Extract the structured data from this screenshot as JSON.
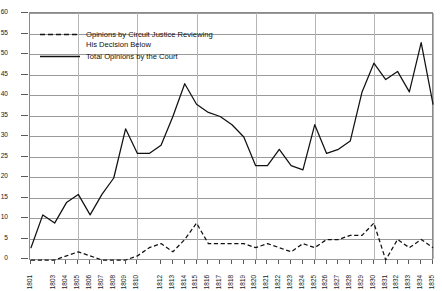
{
  "chart_data": {
    "type": "line",
    "title": "",
    "xlabel": "",
    "ylabel": "",
    "xlim": [
      1801,
      1835
    ],
    "ylim": [
      0,
      60
    ],
    "ytick_step": 5,
    "grid": true,
    "legend_position": "upper-left",
    "yticks": [
      0,
      5,
      10,
      15,
      20,
      25,
      30,
      35,
      40,
      45,
      50,
      55,
      60
    ],
    "categories": [
      "1801",
      "1802",
      "1803",
      "1804",
      "1805",
      "1806",
      "1807",
      "1808",
      "1809",
      "1810",
      "1811",
      "1812",
      "1813",
      "1814",
      "1815",
      "1816",
      "1817",
      "1818",
      "1819",
      "1820",
      "1821",
      "1822",
      "1823",
      "1824",
      "1825",
      "1826",
      "1827",
      "1828",
      "1829",
      "1830",
      "1831",
      "1832",
      "1833",
      "1834",
      "1835"
    ],
    "xtick_labels": [
      "1801",
      "1803",
      "1804",
      "1805",
      "1806",
      "1807",
      "1808",
      "1809",
      "1810",
      "1812",
      "1813",
      "1814",
      "1815",
      "1816",
      "1817",
      "1818",
      "1819",
      "1820",
      "1821",
      "1822",
      "1823",
      "1824",
      "1825",
      "1826",
      "1827",
      "1828",
      "1829",
      "1830",
      "1831",
      "1832",
      "1833",
      "1834",
      "1835"
    ],
    "series": [
      {
        "name": "Total Opinions by the Court",
        "style": "solid",
        "values": [
          3,
          11,
          9,
          14,
          16,
          11,
          16,
          20,
          32,
          26,
          26,
          28,
          35,
          43,
          38,
          36,
          35,
          33,
          30,
          23,
          23,
          27,
          23,
          22,
          33,
          26,
          27,
          29,
          41,
          48,
          44,
          46,
          41,
          53,
          38
        ]
      },
      {
        "name": "Opinions by Circuit Justice Reviewing His Decision Below",
        "style": "dashed",
        "values": [
          0,
          0,
          0,
          1,
          2,
          1,
          0,
          0,
          0,
          1,
          3,
          4,
          2,
          5,
          9,
          4,
          4,
          4,
          4,
          3,
          4,
          3,
          2,
          4,
          3,
          5,
          5,
          6,
          6,
          9,
          0,
          5,
          3,
          5,
          3
        ]
      }
    ]
  },
  "legend": {
    "entries": [
      {
        "swatch": "dashed-line-swatch",
        "label": "Opinions by Circuit Justice Reviewing\nHis Decision Below"
      },
      {
        "swatch": "solid-line-swatch",
        "label": "Total Opinions by the Court"
      }
    ]
  }
}
